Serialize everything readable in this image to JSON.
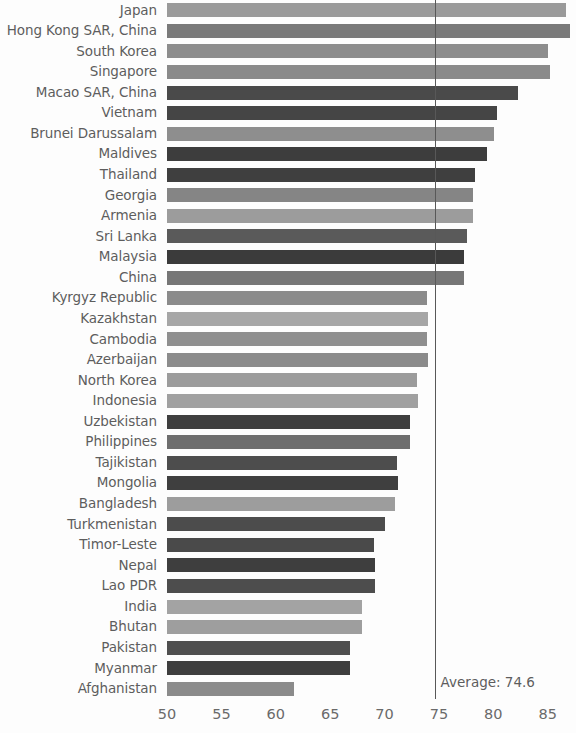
{
  "chart_data": {
    "type": "bar",
    "orientation": "horizontal",
    "title": "",
    "xlabel": "",
    "ylabel": "",
    "xlim": [
      50,
      87.6
    ],
    "xticks": [
      50,
      55,
      60,
      65,
      70,
      75,
      80,
      85
    ],
    "xtick_labels": [
      "50",
      "55",
      "60",
      "65",
      "70",
      "75",
      "80",
      "85"
    ],
    "grid": false,
    "legend": "none",
    "annotations": [
      {
        "name": "average-line",
        "label": "Average: 74.6",
        "value": 74.6,
        "type": "vertical-line"
      }
    ],
    "categories": [
      "Japan",
      "Hong Kong SAR, China",
      "South Korea",
      "Singapore",
      "Macao SAR, China",
      "Vietnam",
      "Brunei Darussalam",
      "Maldives",
      "Thailand",
      "Georgia",
      "Armenia",
      "Sri Lanka",
      "Malaysia",
      "China",
      "Kyrgyz Republic",
      "Kazakhstan",
      "Cambodia",
      "Azerbaijan",
      "North Korea",
      "Indonesia",
      "Uzbekistan",
      "Philippines",
      "Tajikistan",
      "Mongolia",
      "Bangladesh",
      "Turkmenistan",
      "Timor-Leste",
      "Nepal",
      "Lao PDR",
      "India",
      "Bhutan",
      "Pakistan",
      "Myanmar",
      "Afghanistan"
    ],
    "values": [
      86.7,
      87.0,
      85.0,
      85.2,
      82.3,
      80.3,
      80.1,
      79.4,
      78.3,
      78.1,
      78.1,
      77.6,
      77.3,
      77.3,
      73.9,
      74.0,
      73.9,
      74.0,
      73.0,
      73.1,
      72.3,
      72.3,
      71.1,
      71.2,
      71.0,
      70.0,
      69.0,
      69.1,
      69.1,
      67.9,
      67.9,
      66.8,
      66.8,
      61.7
    ],
    "bar_colors": [
      "#9a9a9a",
      "#7a7a7a",
      "#8d8d8d",
      "#8a8a8a",
      "#4a4a4a",
      "#454545",
      "#8e8e8e",
      "#3d3d3d",
      "#3f3f3f",
      "#858585",
      "#9c9c9c",
      "#5a5a5a",
      "#3b3b3b",
      "#767676",
      "#8b8b8b",
      "#a6a6a6",
      "#8f8f8f",
      "#8b8b8b",
      "#9b9b9b",
      "#a0a0a0",
      "#3e3e3e",
      "#6e6e6e",
      "#4d4d4d",
      "#3f3f3f",
      "#9d9d9d",
      "#4c4c4c",
      "#4a4a4a",
      "#3e3e3e",
      "#4d4d4d",
      "#a3a3a3",
      "#9e9e9e",
      "#4f4f4f",
      "#3e3e3e",
      "#8b8b8b"
    ]
  },
  "axis": {
    "average_label": "Average: 74.6"
  }
}
